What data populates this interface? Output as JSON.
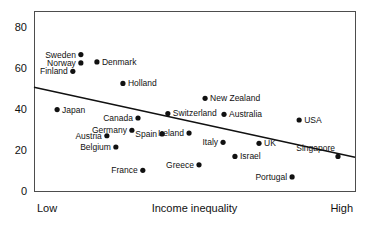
{
  "chart_data": {
    "type": "scatter",
    "title": "",
    "xlabel": "Income inequality",
    "ylabel": "",
    "xlim": [
      0,
      100
    ],
    "ylim": [
      0,
      88
    ],
    "grid": false,
    "legend": "none",
    "x_axis_ticklabels": [
      "Low",
      "High"
    ],
    "y_axis_ticklabels": [
      "0",
      "20",
      "40",
      "60",
      "80"
    ],
    "y_ticks": [
      0,
      20,
      40,
      60,
      80
    ],
    "points": [
      {
        "label": "Sweden",
        "x": 14.6,
        "y": 66.7,
        "label_side": "left"
      },
      {
        "label": "Norway",
        "x": 14.6,
        "y": 62.6,
        "label_side": "left"
      },
      {
        "label": "Denmark",
        "x": 19.6,
        "y": 63.1,
        "label_side": "right"
      },
      {
        "label": "Finland",
        "x": 12.1,
        "y": 58.5,
        "label_side": "left"
      },
      {
        "label": "Holland",
        "x": 27.7,
        "y": 52.6,
        "label_side": "right"
      },
      {
        "label": "New Zealand",
        "x": 53.3,
        "y": 45.3,
        "label_side": "right"
      },
      {
        "label": "Japan",
        "x": 7.2,
        "y": 39.8,
        "label_side": "right"
      },
      {
        "label": "Switzerland",
        "x": 41.7,
        "y": 37.9,
        "label_side": "right"
      },
      {
        "label": "Australia",
        "x": 59.2,
        "y": 37.5,
        "label_side": "right"
      },
      {
        "label": "Canada",
        "x": 32.4,
        "y": 35.7,
        "label_side": "left"
      },
      {
        "label": "USA",
        "x": 82.6,
        "y": 34.7,
        "label_side": "right"
      },
      {
        "label": "Spain",
        "x": 39.9,
        "y": 27.9,
        "label_side": "left"
      },
      {
        "label": "Germany",
        "x": 30.5,
        "y": 29.7,
        "label_side": "left"
      },
      {
        "label": "Austria",
        "x": 22.7,
        "y": 27.0,
        "label_side": "left"
      },
      {
        "label": "Ireland",
        "x": 48.3,
        "y": 28.3,
        "label_side": "left"
      },
      {
        "label": "Italy",
        "x": 58.9,
        "y": 23.8,
        "label_side": "left"
      },
      {
        "label": "Belgium",
        "x": 25.5,
        "y": 21.5,
        "label_side": "left"
      },
      {
        "label": "UK",
        "x": 70.1,
        "y": 23.3,
        "label_side": "right"
      },
      {
        "label": "Israel",
        "x": 62.6,
        "y": 16.9,
        "label_side": "right"
      },
      {
        "label": "Singapore",
        "x": 94.7,
        "y": 16.9,
        "label_side": "above-left"
      },
      {
        "label": "France",
        "x": 33.9,
        "y": 10.1,
        "label_side": "left"
      },
      {
        "label": "Greece",
        "x": 51.4,
        "y": 12.8,
        "label_side": "left-far"
      },
      {
        "label": "Portugal",
        "x": 80.4,
        "y": 6.9,
        "label_side": "left"
      }
    ],
    "trend_line": {
      "x_start": 0,
      "y_start": 50.7,
      "x_end": 100,
      "y_end": 16.5
    }
  }
}
